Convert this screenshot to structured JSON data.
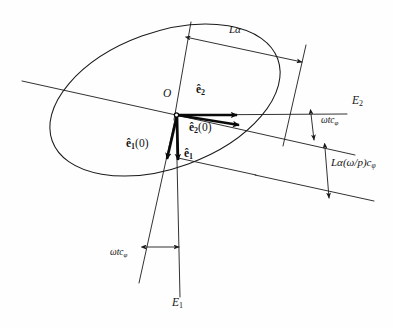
{
  "figure": {
    "background_color": "#fefefe",
    "ink_color": "#1b1b1b",
    "vector_color": "#0a0a0a"
  },
  "axes": [
    {
      "name": "E2",
      "label": "E",
      "subscript": "2",
      "orientation": "horizontal",
      "label_x": 352,
      "label_y": 101
    },
    {
      "name": "E1",
      "label": "E",
      "subscript": "1",
      "orientation": "vertical",
      "label_x": 172,
      "label_y": 303
    }
  ],
  "origin": {
    "name": "O",
    "label": "O",
    "x": 176,
    "y": 115,
    "label_x": 163,
    "label_y": 94
  },
  "vectors": [
    {
      "name": "e2-hat",
      "base": "e",
      "subscript": "2",
      "argument": "",
      "label": "ê2",
      "label_x": 196,
      "label_y": 90,
      "from": [
        176,
        115
      ],
      "to": [
        243,
        115
      ]
    },
    {
      "name": "e2-hat-zero",
      "base": "e",
      "subscript": "2",
      "argument": "(0)",
      "label": "ê2(0)",
      "label_x": 190,
      "label_y": 128,
      "from": [
        176,
        115
      ],
      "to": [
        245,
        126
      ]
    },
    {
      "name": "e1-hat",
      "base": "e",
      "subscript": "1",
      "argument": "",
      "label": "ê1",
      "label_x": 182,
      "label_y": 152,
      "from": [
        176,
        115
      ],
      "to": [
        178,
        166
      ]
    },
    {
      "name": "e1-hat-zero",
      "base": "e",
      "subscript": "1",
      "argument": "(0)",
      "label": "ê1(0)",
      "label_x": 127,
      "label_y": 143,
      "from": [
        176,
        115
      ],
      "to": [
        166,
        166
      ]
    }
  ],
  "dimensions": [
    {
      "name": "L-alpha",
      "text": "Lα",
      "label_x": 229,
      "label_y": 30,
      "kind": "double-arrow"
    },
    {
      "name": "L-alpha-omega-over-p-c-phi",
      "text": "Lα(ω/p)c",
      "subscript": "φ",
      "label_x": 330,
      "label_y": 163,
      "kind": "double-arrow"
    },
    {
      "name": "omega-t-c-phi-upper",
      "text": "ωtc",
      "subscript": "φ",
      "label_x": 322,
      "label_y": 121,
      "kind": "double-arrow"
    },
    {
      "name": "omega-t-c-phi-lower",
      "text": "ωtc",
      "subscript": "φ",
      "label_x": 111,
      "label_y": 252,
      "kind": "double-arrow"
    }
  ],
  "ellipse": {
    "name": "orbit-ellipse",
    "center_x": 165,
    "center_y": 100,
    "radius_x": 120,
    "radius_y": 68,
    "rotation_deg": -20
  }
}
